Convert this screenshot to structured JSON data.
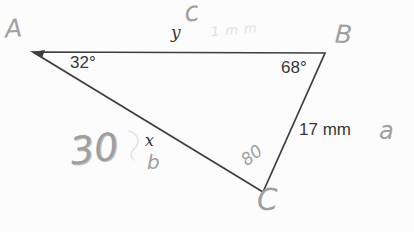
{
  "figure": {
    "vertices": {
      "A": {
        "label": "A",
        "x": 33,
        "y": 52
      },
      "B": {
        "label": "B",
        "x": 325,
        "y": 53
      },
      "C": {
        "label": "C",
        "x": 263,
        "y": 192
      }
    },
    "angles": {
      "A": "32°",
      "B": "68°"
    },
    "sides": {
      "AB": "y",
      "AC": "x",
      "BC": "17 mm"
    }
  },
  "handwritten": {
    "side_ab_letter": "c",
    "side_bc_letter": "a",
    "side_ac_letter": "b",
    "x_value": "30",
    "angle_c_value": "80",
    "faint_note": "1mm"
  },
  "colors": {
    "ink": "#383838",
    "line": "#3f3f3f",
    "pencil": "#9f9f9f",
    "pencil_faint": "#e2e2e2",
    "paper": "#fcfcfc"
  }
}
